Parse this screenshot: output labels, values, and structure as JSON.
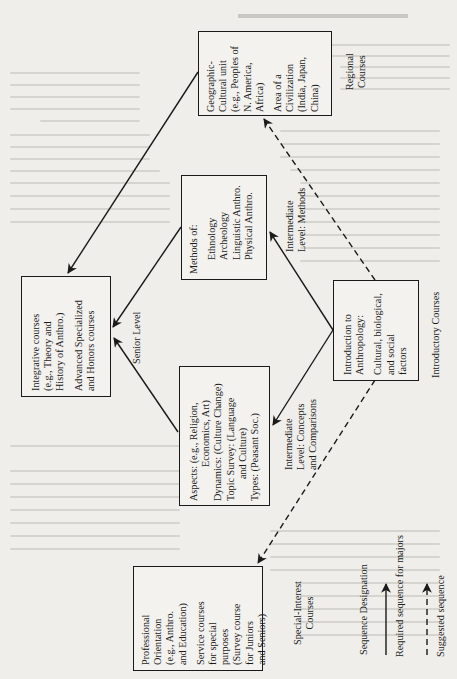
{
  "page_heading": "CURRICULUM LEVELS",
  "diagram": {
    "boxes": {
      "geographic": {
        "lines_a": [
          "Geographic-",
          "Cultural unit",
          "(e.g., Peoples of",
          "N. America,",
          "Africa)"
        ],
        "lines_b": [
          "Area of a",
          "Civilization",
          "(India, Japan,",
          "China)"
        ]
      },
      "methods": {
        "lines_a": [
          "Methods of:"
        ],
        "lines_b": [
          "Ethnology",
          "Archeology",
          "Linguistic Anthro.",
          "Physical Anthro."
        ]
      },
      "introduction": {
        "lines_a": [
          "Introduction to",
          "Anthropology:"
        ],
        "lines_b": [
          "Cultural, biological,",
          "and social",
          "factors"
        ]
      },
      "integrative": {
        "lines_a": [
          "Integrative courses",
          "(e.g., Theory and",
          "History of Anthro.)"
        ],
        "lines_b": [
          "Advanced Specialized",
          "and Honors courses"
        ]
      },
      "aspects": {
        "lines_a": [
          "Aspects: (e.g., Religion,",
          "Economics, Art)",
          "Dynamics: (Culture Change)",
          "Topic Survey: (Language",
          "and Culture)",
          "Types: (Peasant Soc.)"
        ]
      },
      "professional": {
        "lines_a": [
          "Professional",
          "Orientation",
          "(e.g., Anthro.",
          "and Education)"
        ],
        "lines_b": [
          "Service courses",
          "for special",
          "purposes",
          "(Survey course",
          "for Juniors",
          "and Seniors)"
        ]
      }
    },
    "level_labels": {
      "regional": [
        "Regional",
        "Courses"
      ],
      "intermediate_methods": [
        "Intermediate",
        "Level: Methods"
      ],
      "introductory": [
        "Introductory Courses"
      ],
      "senior": [
        "Senior Level"
      ],
      "intermediate_concepts": [
        "Intermediate",
        "Level: Concepts",
        "and Comparisons"
      ],
      "special_interest": [
        "Special-Interest",
        "Courses"
      ]
    },
    "legend": {
      "title": "Sequence Designation",
      "required": "Required sequence for majors",
      "suggested": "Suggested sequence"
    },
    "connections": [
      {
        "from": "introduction",
        "to": "methods",
        "style": "solid"
      },
      {
        "from": "introduction",
        "to": "aspects",
        "style": "solid"
      },
      {
        "from": "introduction",
        "to": "geographic",
        "style": "dashed"
      },
      {
        "from": "introduction",
        "to": "professional",
        "style": "dashed"
      },
      {
        "from": "methods",
        "to": "integrative",
        "style": "solid"
      },
      {
        "from": "aspects",
        "to": "integrative",
        "style": "solid"
      },
      {
        "from": "geographic",
        "to": "integrative",
        "style": "solid"
      }
    ]
  }
}
